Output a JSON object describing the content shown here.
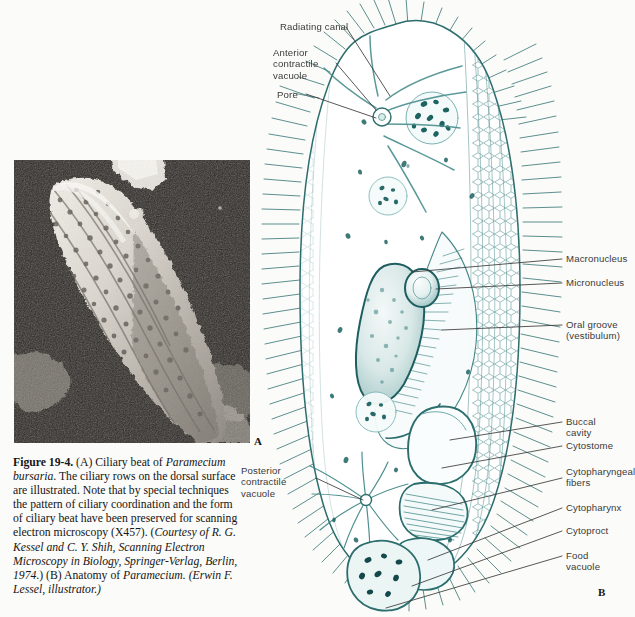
{
  "figure": {
    "panel_a_letter": "A",
    "panel_b_letter": "B",
    "caption": {
      "figure_number": "Figure 19-4.",
      "part_a_text": " (A) Ciliary beat of ",
      "species_italic_1": "Paramecium bursaria",
      "body_text_1": ". The ciliary rows on the dorsal surface are illustrated. Note that by special techniques the pattern of ciliary coordination and the form of ciliary beat have been preserved for scanning electron microscopy (X457). (",
      "citation_italic": "Courtesy of R. G. Kessel and C. Y. Shih, Scanning Electron Microscopy in Biology, Springer-Verlag, Berlin, 1974.",
      "body_text_2": ") (B) Anatomy of ",
      "species_italic_2": "Paramecium.",
      "illustrator_italic": "(Erwin F. Lessel, illustrator.)"
    }
  },
  "labels_left": [
    {
      "id": "radiating-canal",
      "text": "Radiating canal"
    },
    {
      "id": "anterior-contractile-vacuole",
      "text": "Anterior\ncontractile\nvacuole"
    },
    {
      "id": "pore",
      "text": "Pore"
    },
    {
      "id": "posterior-contractile-vacuole",
      "text": "Posterior\ncontractile\nvacuole"
    }
  ],
  "labels_right": [
    {
      "id": "macronucleus",
      "text": "Macronucleus"
    },
    {
      "id": "micronucleus",
      "text": "Micronucleus"
    },
    {
      "id": "oral-groove",
      "text": "Oral groove\n(vestibulum)"
    },
    {
      "id": "buccal-cavity",
      "text": "Buccal cavity"
    },
    {
      "id": "cytostome",
      "text": "Cytostome"
    },
    {
      "id": "cytopharyngeal-fibers",
      "text": "Cytopharyngeal\nfibers"
    },
    {
      "id": "cytopharynx",
      "text": "Cytopharynx"
    },
    {
      "id": "cytoproct",
      "text": "Cytoproct"
    },
    {
      "id": "food-vacuole",
      "text": "Food vacuole"
    }
  ],
  "colors": {
    "page_background": "#fbfbf9",
    "drawing_teal": "#2a6b6b",
    "drawing_teal_dark": "#14494c",
    "drawing_teal_light": "#7fb0b0",
    "leader_line": "#3a3a3a",
    "caption_text": "#151515",
    "label_text": "#3a3a3a",
    "micrograph_background": "#2b2723",
    "micrograph_specimen": "#e8e4dd"
  }
}
